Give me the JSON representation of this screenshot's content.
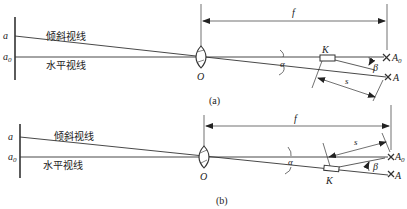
{
  "diagram": {
    "panel_a": {
      "caption": "(a)",
      "labels": {
        "a": "a",
        "a0": "a",
        "a0_sub": "0",
        "inclined_line": "倾斜视线",
        "horizontal_line": "水平视线",
        "lens": "O",
        "focal": "f",
        "alpha": "α",
        "K": "K",
        "beta": "β",
        "A0": "A",
        "A0_sub": "0",
        "A": "A",
        "s": "s"
      }
    },
    "panel_b": {
      "caption": "(b)",
      "labels": {
        "a": "a",
        "a0": "a",
        "a0_sub": "0",
        "inclined_line": "倾斜视线",
        "horizontal_line": "水平视线",
        "lens": "O",
        "focal": "f",
        "alpha": "α",
        "K": "K",
        "beta": "β",
        "A0": "A",
        "A0_sub": "0",
        "A": "A",
        "s": "s"
      }
    }
  }
}
